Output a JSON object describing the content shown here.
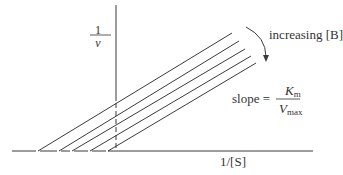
{
  "diagram": {
    "type": "lineweaver-burk-plot",
    "y_axis": {
      "numerator": "1",
      "denominator": "v"
    },
    "x_axis": {
      "label": "1/[S]"
    },
    "annotation": {
      "arrow_label": "increasing [B]"
    },
    "slope": {
      "prefix": "slope =",
      "numerator_symbol": "K",
      "numerator_subscript": "m",
      "denominator_symbol": "V",
      "denominator_subscript": "max"
    },
    "line_count": 5,
    "colors": {
      "line": "#3a3a3a",
      "text": "#333333",
      "background": "#ffffff"
    }
  }
}
